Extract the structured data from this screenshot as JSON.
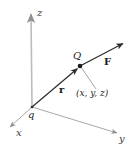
{
  "figure": {
    "kind": "3d-coordinate-vector-diagram",
    "background_color": "#ffffff",
    "axis_color": "#b0b0b0",
    "vector_color": "#2b2b2b",
    "leader_color": "#9a9a9a",
    "text_color": "#262626"
  },
  "labels": {
    "z_axis": "z",
    "y_axis": "y",
    "x_axis": "x",
    "charge": "q",
    "point": "Q",
    "position_vector": "r",
    "force_vector": "F",
    "coordinates": "(x, y, z)"
  },
  "geometry": {
    "origin": {
      "x": 32,
      "y": 107
    },
    "z_axis_tip": {
      "x": 31,
      "y": 12
    },
    "y_axis_tip": {
      "x": 120,
      "y": 134
    },
    "x_axis_tip": {
      "x": 7,
      "y": 129
    },
    "point_Q": {
      "x": 80,
      "y": 66
    },
    "force_tip": {
      "x": 126,
      "y": 41
    },
    "leader_end": {
      "x": 96,
      "y": 89
    }
  }
}
